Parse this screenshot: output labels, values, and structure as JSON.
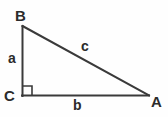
{
  "diagram": {
    "type": "right-triangle",
    "background_color": "#fefefe",
    "stroke_color": "#3a3a3a",
    "label_color": "#2b2b2b",
    "stroke_width": 2,
    "vertices": [
      {
        "id": "B",
        "label": "B",
        "x": 22,
        "y": 26
      },
      {
        "id": "C",
        "label": "C",
        "x": 22,
        "y": 96
      },
      {
        "id": "A",
        "label": "A",
        "x": 148,
        "y": 96
      }
    ],
    "sides": [
      {
        "id": "a",
        "label": "a",
        "from": "B",
        "to": "C",
        "orientation": "vertical"
      },
      {
        "id": "b",
        "label": "b",
        "from": "C",
        "to": "A",
        "orientation": "horizontal"
      },
      {
        "id": "c",
        "label": "c",
        "from": "B",
        "to": "A",
        "orientation": "hypotenuse"
      }
    ],
    "right_angle": {
      "at": "C",
      "marker": "square",
      "size": 8
    }
  }
}
